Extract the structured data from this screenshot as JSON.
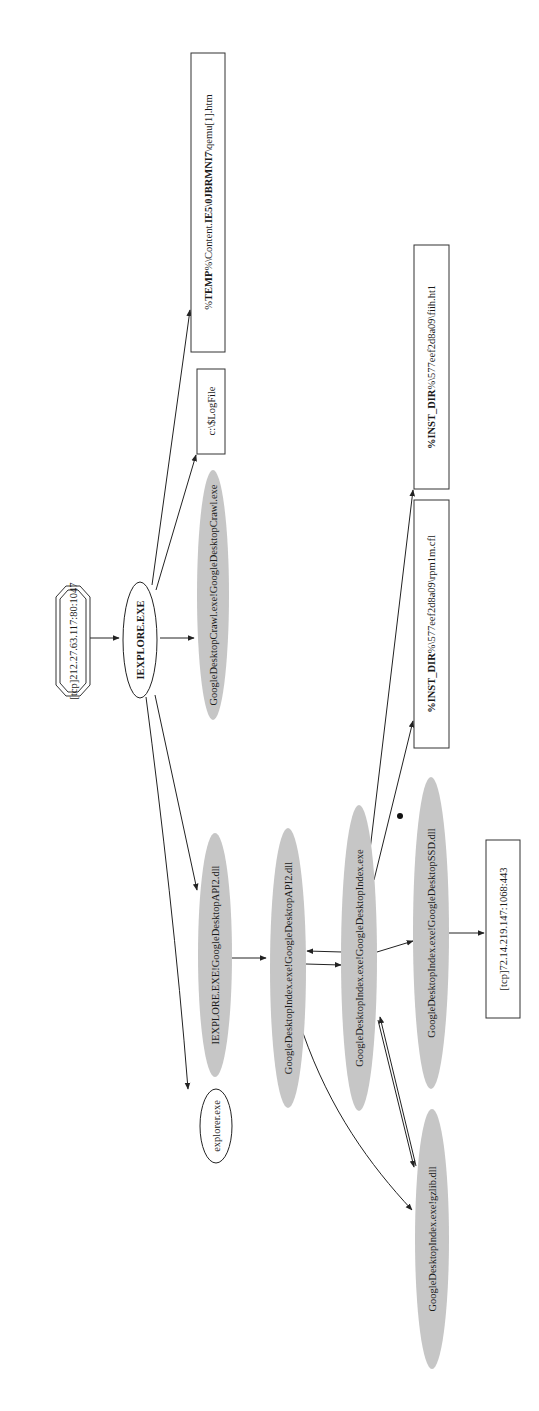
{
  "diagram": {
    "type": "process-graph",
    "orientation": "rotated-90-ccw",
    "colors": {
      "grey_node": "#c6c6c6",
      "edge": "#222222",
      "background": "#ffffff"
    },
    "nodes": {
      "tcp_src": {
        "label": "[tcp]212.27.63.117:80:1047",
        "shape": "double-octagon"
      },
      "iexplore": {
        "label": "IEXPLORE.EXE",
        "shape": "ellipse"
      },
      "temp_htm": {
        "label_prefix": "%",
        "label_bold": "TEMP",
        "label_mid": "%\\Content.",
        "label_bold2": "IE5\\0JBRMNI7",
        "label_suffix": "\\qemu[1].htm",
        "label": "%TEMP%\\Content.IE5\\0JBRMNI7\\qemu[1].htm",
        "shape": "box"
      },
      "logfile": {
        "label": "c:\\$LogFile",
        "shape": "box"
      },
      "crawl": {
        "label": "GoogleDesktopCrawl.exe!GoogleDesktopCrawl.exe",
        "shape": "grey-ellipse"
      },
      "ie_api2": {
        "label": "IEXPLORE.EXE!GoogleDesktopAPI2.dll",
        "shape": "grey-ellipse"
      },
      "explorer": {
        "label": "explorer.exe",
        "shape": "ellipse"
      },
      "idx_api2": {
        "label": "GoogleDesktopIndex.exe!GoogleDesktopAPI2.dll",
        "shape": "grey-ellipse"
      },
      "idx_exe": {
        "label": "GoogleDesktopIndex.exe!GoogleDesktopIndex.exe",
        "shape": "grey-ellipse"
      },
      "inst_cfl": {
        "label_bold": "%INST_DIR",
        "label_suffix": "%\\577eef2d8a09\\rpm1m.cfl",
        "label": "%INST_DIR%\\577eef2d8a09\\rpm1m.cfl",
        "shape": "box"
      },
      "inst_ht1": {
        "label_bold": "%INST_DIR",
        "label_suffix": "%\\577eef2d8a09\\fiih.ht1",
        "label": "%INST_DIR%\\577eef2d8a09\\fiih.ht1",
        "shape": "box"
      },
      "idx_ssd": {
        "label": "GoogleDesktopIndex.exe!GoogleDesktopSSD.dll",
        "shape": "grey-ellipse"
      },
      "tcp_dst": {
        "label": "[tcp]72.14.219.147:1068:443",
        "shape": "box"
      },
      "idx_gzlib": {
        "label": "GoogleDesktopIndex.exe!gzlib.dll",
        "shape": "grey-ellipse"
      }
    },
    "edges": [
      {
        "from": "tcp_src",
        "to": "iexplore"
      },
      {
        "from": "iexplore",
        "to": "temp_htm"
      },
      {
        "from": "iexplore",
        "to": "logfile"
      },
      {
        "from": "iexplore",
        "to": "crawl"
      },
      {
        "from": "iexplore",
        "to": "ie_api2"
      },
      {
        "from": "iexplore",
        "to": "explorer"
      },
      {
        "from": "ie_api2",
        "to": "idx_api2"
      },
      {
        "from": "idx_api2",
        "to": "idx_exe"
      },
      {
        "from": "idx_exe",
        "to": "idx_api2"
      },
      {
        "from": "idx_api2",
        "to": "idx_gzlib"
      },
      {
        "from": "idx_exe",
        "to": "inst_cfl"
      },
      {
        "from": "idx_exe",
        "to": "inst_ht1"
      },
      {
        "from": "idx_exe",
        "to": "idx_ssd"
      },
      {
        "from": "idx_exe",
        "to": "idx_gzlib"
      },
      {
        "from": "idx_gzlib",
        "to": "idx_exe"
      },
      {
        "from": "idx_ssd",
        "to": "tcp_dst"
      }
    ]
  }
}
